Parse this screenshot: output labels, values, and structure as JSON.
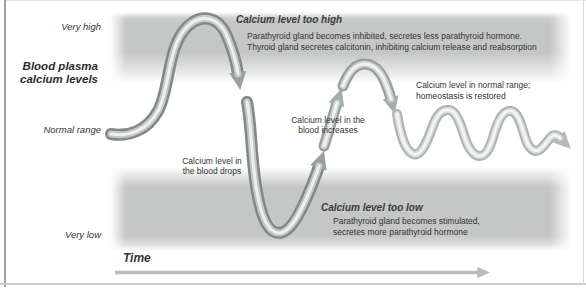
{
  "figure": {
    "y_axis": {
      "title": "Blood plasma\ncalcium levels",
      "tick_very_high": "Very high",
      "tick_normal_range": "Normal range",
      "tick_very_low": "Very low"
    },
    "x_axis": {
      "label": "Time"
    },
    "annotations": {
      "too_high": {
        "heading": "Calcium level too high",
        "body": "Parathyroid gland becomes inhibited, secretes less parathyroid hormone.\nThyroid gland secretes calcitonin, inhibiting calcium release and reabsorption"
      },
      "drops": "Calcium level in\nthe blood drops",
      "increases": "Calcium level in the\nblood increases",
      "restored": "Calcium level in normal range;\nhomeostasis is restored",
      "too_low": {
        "heading": "Calcium level too low",
        "body": "Parathyroid gland becomes stimulated,\nsecretes more parathyroid hormone"
      }
    },
    "colors": {
      "band_gray": "#c5c6c6",
      "curve_dark": "#828888",
      "curve_light": "#adb3b3",
      "curve_highlight": "#eef0f0",
      "arrow_dark": "#9aa0a0",
      "arrow_light": "#b3b9b9",
      "time_arrow": "#b7bcba",
      "text": "#333333"
    }
  }
}
